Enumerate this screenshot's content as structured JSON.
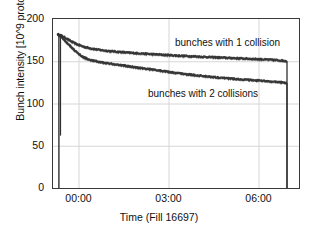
{
  "chart_data": {
    "type": "line",
    "title": "",
    "xlabel": "Time (Fill 16697)",
    "ylabel": "Bunch intensity [10^9 protons]",
    "xlim": [
      -0.85,
      7.35
    ],
    "ylim": [
      0,
      200
    ],
    "grid": true,
    "legend_position": "inline-annotations",
    "yticks": [
      0,
      50,
      100,
      150,
      200
    ],
    "ytick_labels": [
      "0",
      "50",
      "100",
      "150",
      "200"
    ],
    "xticks": [
      0,
      3,
      6
    ],
    "xtick_labels": [
      "00:00",
      "03:00",
      "06:00"
    ],
    "annotations": [
      {
        "text": "bunches with 1 collision",
        "x": 4.2,
        "y": 163
      },
      {
        "text": "bunches with 2 collisions",
        "x": 3.3,
        "y": 114
      }
    ],
    "series": [
      {
        "name": "bunches with 1 collision",
        "color": "#303030",
        "x": [
          -0.7,
          -0.66,
          -0.62,
          -0.58,
          -0.52,
          -0.45,
          -0.35,
          -0.22,
          -0.05,
          0.15,
          0.4,
          0.7,
          1.0,
          1.35,
          1.7,
          2.05,
          2.4,
          2.8,
          3.2,
          3.6,
          4.0,
          4.4,
          4.8,
          5.2,
          5.6,
          6.0,
          6.4,
          6.7,
          6.9,
          6.95,
          6.95
        ],
        "y": [
          182.0,
          181.6,
          181.2,
          180.6,
          179.6,
          178.2,
          176.0,
          173.2,
          170.2,
          167.6,
          165.4,
          163.6,
          162.3,
          161.2,
          160.2,
          159.4,
          158.6,
          157.8,
          157.0,
          156.3,
          155.6,
          155.0,
          154.4,
          153.8,
          153.2,
          152.6,
          151.9,
          151.2,
          150.5,
          149.8,
          0.0
        ]
      },
      {
        "name": "bunches with 2 collisions",
        "color": "#303030",
        "x": [
          -0.7,
          -0.66,
          -0.62,
          -0.58,
          -0.52,
          -0.45,
          -0.35,
          -0.22,
          -0.05,
          0.15,
          0.4,
          0.7,
          1.0,
          1.35,
          1.7,
          2.05,
          2.4,
          2.8,
          3.2,
          3.6,
          4.0,
          4.4,
          4.8,
          5.2,
          5.6,
          6.0,
          6.4,
          6.7,
          6.9,
          6.95,
          6.95
        ],
        "y": [
          182.0,
          181.2,
          180.2,
          179.0,
          177.2,
          174.6,
          171.0,
          166.2,
          160.4,
          155.2,
          151.4,
          149.2,
          147.6,
          145.8,
          144.0,
          142.3,
          140.6,
          138.6,
          136.6,
          134.8,
          133.2,
          131.8,
          130.5,
          129.3,
          128.2,
          127.2,
          126.2,
          125.4,
          124.8,
          124.4,
          0.0
        ]
      }
    ],
    "spike": {
      "x": -0.6,
      "y_top": 182.0,
      "y_bottom": 62.0
    },
    "colors": {
      "data": "#303030",
      "axis": "#3a3a3a",
      "grid": "#d6d6d6",
      "text": "#111111",
      "background": "#ffffff"
    }
  }
}
